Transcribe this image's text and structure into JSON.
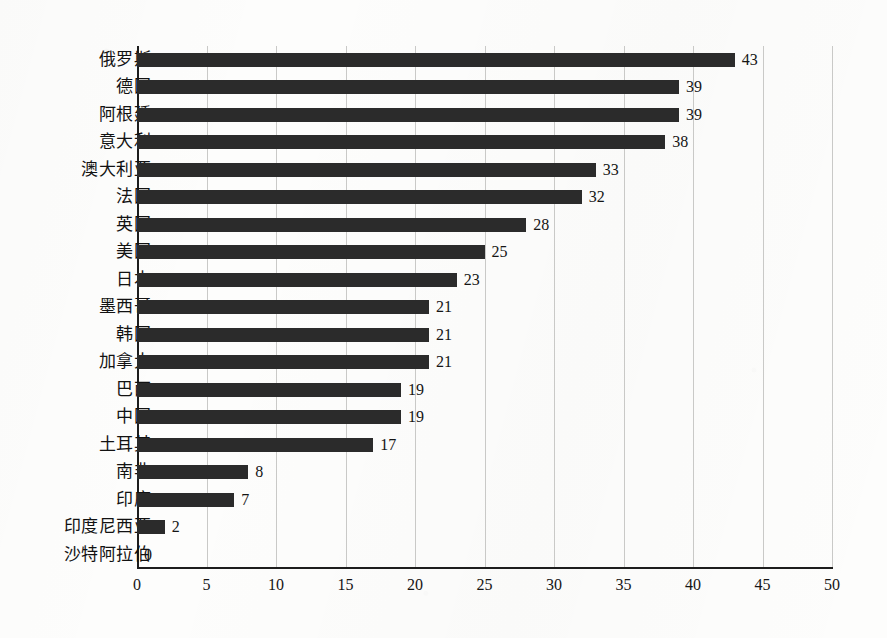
{
  "chart_data": {
    "type": "bar",
    "orientation": "horizontal",
    "title": "",
    "subtitle": "",
    "xlabel": "",
    "ylabel": "",
    "xlim": [
      0,
      50
    ],
    "xticks": [
      "0",
      "5",
      "10",
      "15",
      "20",
      "25",
      "30",
      "35",
      "40",
      "45",
      "50"
    ],
    "grid": "vertical",
    "legend": "none",
    "categories": [
      "俄罗斯",
      "德国",
      "阿根廷",
      "意大利",
      "澳大利亚",
      "法国",
      "英国",
      "美国",
      "日本",
      "墨西哥",
      "韩国",
      "加拿大",
      "巴西",
      "中国",
      "土耳其",
      "南非",
      "印度",
      "印度尼西亚",
      "沙特阿拉伯"
    ],
    "values": [
      43,
      39,
      39,
      38,
      33,
      32,
      28,
      25,
      23,
      21,
      21,
      21,
      19,
      19,
      17,
      8,
      7,
      2,
      0
    ],
    "value_labels": [
      "43",
      "39",
      "39",
      "38",
      "33",
      "32",
      "28",
      "25",
      "23",
      "21",
      "21",
      "21",
      "19",
      "19",
      "17",
      "8",
      "7",
      "2",
      "0"
    ]
  },
  "style": {
    "bar_color": "#2b2b2b",
    "grid_color": "#c9c9c7",
    "axis_color": "#1d1d1d",
    "background": "#fdfdfc",
    "text_color": "#121212"
  }
}
